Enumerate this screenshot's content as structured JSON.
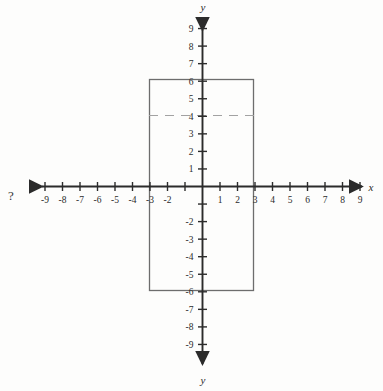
{
  "figure": {
    "background_color": "#fdfdfc",
    "ink_color": "#3a3a3a",
    "axis_color": "#2b2b2b",
    "shape_color": "#6d6d6d",
    "dash_color": "#9a9a9a",
    "question_mark": "?",
    "x_axis_name": "x",
    "y_axis_name_top": "y",
    "y_axis_name_bottom": "y"
  },
  "chart_data": {
    "type": "scatter",
    "title": "",
    "subtitle": "",
    "xlabel": "x",
    "ylabel": "y",
    "grid": false,
    "legend": "none",
    "xlim": [
      -10,
      10
    ],
    "ylim": [
      -10,
      10
    ],
    "x_ticks": [
      -9,
      -8,
      -7,
      -6,
      -5,
      -4,
      -3,
      -2,
      -1,
      1,
      2,
      3,
      4,
      5,
      6,
      7,
      8,
      9
    ],
    "y_ticks": [
      -9,
      -8,
      -7,
      -6,
      -5,
      -4,
      -3,
      -2,
      -1,
      1,
      2,
      3,
      4,
      5,
      6,
      7,
      8,
      9
    ],
    "x_tick_labels": [
      "-9",
      "-8",
      "-7",
      "-6",
      "-5",
      "-4",
      "-3",
      "-2",
      "",
      "1",
      "2",
      "3",
      "4",
      "5",
      "6",
      "7",
      "8",
      "9"
    ],
    "y_tick_labels": [
      "-9",
      "-8",
      "-7",
      "-6",
      "-5",
      "-4",
      "-3",
      "-2",
      "",
      "1",
      "2",
      "3",
      "4",
      "5",
      "6",
      "7",
      "8",
      "9"
    ],
    "origin_label": "",
    "annotations": [
      {
        "name": "rectangle",
        "kind": "rectangle",
        "x_min": -3,
        "x_max": 3,
        "y_min": -6,
        "y_max": 6,
        "width": 6,
        "height": 12,
        "filled": false
      },
      {
        "name": "dashed-horizontal-segment",
        "kind": "dashed-line",
        "y": 4,
        "x_start": -3,
        "x_end": 3
      },
      {
        "name": "question-mark",
        "kind": "text",
        "text": "?",
        "x": -9.6,
        "y": 0.6
      }
    ],
    "series": []
  },
  "axis": {
    "x_ticks": [
      {
        "value": -9,
        "label": "-9"
      },
      {
        "value": -8,
        "label": "-8"
      },
      {
        "value": -7,
        "label": "-7"
      },
      {
        "value": -6,
        "label": "-6"
      },
      {
        "value": -5,
        "label": "-5"
      },
      {
        "value": -4,
        "label": "-4"
      },
      {
        "value": -3,
        "label": "-3"
      },
      {
        "value": -2,
        "label": "-2"
      },
      {
        "value": -1,
        "label": ""
      },
      {
        "value": 1,
        "label": "1"
      },
      {
        "value": 2,
        "label": "2"
      },
      {
        "value": 3,
        "label": "3"
      },
      {
        "value": 4,
        "label": "4"
      },
      {
        "value": 5,
        "label": "5"
      },
      {
        "value": 6,
        "label": "6"
      },
      {
        "value": 7,
        "label": "7"
      },
      {
        "value": 8,
        "label": "8"
      },
      {
        "value": 9,
        "label": "9"
      }
    ],
    "y_ticks": [
      {
        "value": 9,
        "label": "9"
      },
      {
        "value": 8,
        "label": "8"
      },
      {
        "value": 7,
        "label": "7"
      },
      {
        "value": 6,
        "label": "6"
      },
      {
        "value": 5,
        "label": "5"
      },
      {
        "value": 4,
        "label": "4"
      },
      {
        "value": 3,
        "label": "3"
      },
      {
        "value": 2,
        "label": "2"
      },
      {
        "value": 1,
        "label": "1"
      },
      {
        "value": -1,
        "label": ""
      },
      {
        "value": -2,
        "label": "-2"
      },
      {
        "value": -3,
        "label": "-3"
      },
      {
        "value": -4,
        "label": "-4"
      },
      {
        "value": -5,
        "label": "-5"
      },
      {
        "value": -6,
        "label": "-6"
      },
      {
        "value": -7,
        "label": "-7"
      },
      {
        "value": -8,
        "label": "-8"
      },
      {
        "value": -9,
        "label": "-9"
      }
    ]
  }
}
